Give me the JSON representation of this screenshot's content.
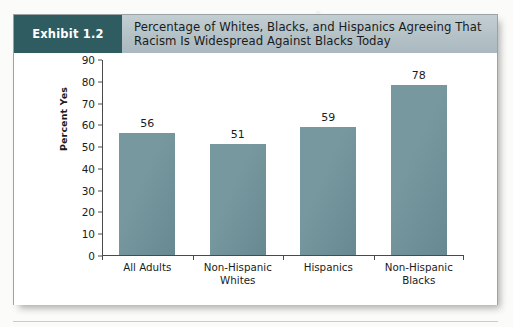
{
  "exhibit": {
    "badge_label": "Exhibit 1.2",
    "title": "Percentage of Whites, Blacks, and Hispanics Agreeing That Racism Is Widespread Against Blacks Today",
    "badge_color": "#2f5c60",
    "header_band_color": "#b4c2c7",
    "card_background": "#ffffff"
  },
  "chart_data": {
    "type": "bar",
    "title": "Percentage of Whites, Blacks, and Hispanics Agreeing That Racism Is Widespread Against Blacks Today",
    "categories": [
      "All Adults",
      "Non-Hispanic\nWhites",
      "Hispanics",
      "Non-Hispanic\nBlacks"
    ],
    "values": [
      56,
      51,
      59,
      78
    ],
    "value_labels": [
      "56",
      "51",
      "59",
      "78"
    ],
    "xlabel": "",
    "ylabel": "Percent Yes",
    "ylim": [
      0,
      90
    ],
    "yticks": [
      0,
      10,
      20,
      30,
      40,
      50,
      60,
      70,
      80,
      90
    ],
    "ytick_labels": [
      "0",
      "10",
      "20",
      "30",
      "40",
      "50",
      "60",
      "70",
      "80",
      "90"
    ],
    "grid": false,
    "legend": false,
    "bar_color": "#6d9098"
  }
}
